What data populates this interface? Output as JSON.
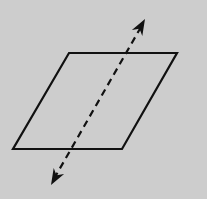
{
  "diagram": {
    "background": "#cdcdcd",
    "stroke_color": "#111111",
    "plane": {
      "shape": "parallelogram",
      "points": [
        [
          69,
          53
        ],
        [
          177,
          53
        ],
        [
          122,
          149
        ],
        [
          13,
          149
        ]
      ],
      "stroke_width": 2.2
    },
    "line": {
      "style": "dashed",
      "start": [
        141,
        27
      ],
      "end": [
        55,
        177
      ],
      "dash": "7,5",
      "stroke_width": 2.2,
      "arrowheads": {
        "top": {
          "tip": [
            145,
            19
          ],
          "direction": "up-right"
        },
        "bottom": {
          "tip": [
            51,
            185
          ],
          "direction": "down-left"
        }
      }
    }
  }
}
